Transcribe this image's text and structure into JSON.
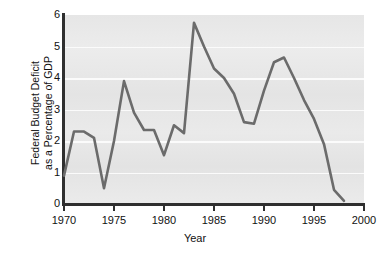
{
  "chart_data": {
    "type": "line",
    "title": "",
    "xlabel": "Year",
    "ylabel": "Federal Budget Deficit as a Percentage of GDP",
    "ylabel_line1": "Federal Budget Deficit",
    "ylabel_line2": "as a Percentage of GDP",
    "xlim": [
      1970,
      2000
    ],
    "ylim": [
      0,
      6
    ],
    "xticks": [
      1970,
      1975,
      1980,
      1985,
      1990,
      1995,
      2000
    ],
    "xtick_labels": [
      "1970",
      "1975",
      "1980",
      "1985",
      "1990",
      "1995",
      "2000"
    ],
    "yticks": [
      0,
      1,
      2,
      3,
      4,
      5,
      6
    ],
    "ytick_labels": [
      "0",
      "1",
      "2",
      "3",
      "4",
      "5",
      "6"
    ],
    "grid": true,
    "grid_color": "#fbfbfb",
    "plot_background": "#e8e8e8",
    "line_color": "#6b6b6b",
    "legend": null,
    "x": [
      1970,
      1971,
      1972,
      1973,
      1974,
      1975,
      1976,
      1977,
      1978,
      1979,
      1980,
      1981,
      1982,
      1983,
      1984,
      1985,
      1986,
      1987,
      1988,
      1989,
      1990,
      1991,
      1992,
      1993,
      1994,
      1995,
      1996,
      1997,
      1998
    ],
    "values": [
      0.9,
      2.3,
      2.3,
      2.1,
      0.5,
      2.0,
      3.9,
      2.9,
      2.35,
      2.35,
      1.55,
      2.5,
      2.25,
      5.75,
      5.0,
      4.3,
      4.0,
      3.5,
      2.6,
      2.55,
      3.6,
      4.5,
      4.65,
      4.0,
      3.3,
      2.7,
      1.9,
      0.45,
      0.1
    ],
    "series": [
      {
        "name": "Federal Budget Deficit as a Percentage of GDP",
        "values": [
          0.9,
          2.3,
          2.3,
          2.1,
          0.5,
          2.0,
          3.9,
          2.9,
          2.35,
          2.35,
          1.55,
          2.5,
          2.25,
          5.75,
          5.0,
          4.3,
          4.0,
          3.5,
          2.6,
          2.55,
          3.6,
          4.5,
          4.65,
          4.0,
          3.3,
          2.7,
          1.9,
          0.45,
          0.1
        ]
      }
    ]
  }
}
